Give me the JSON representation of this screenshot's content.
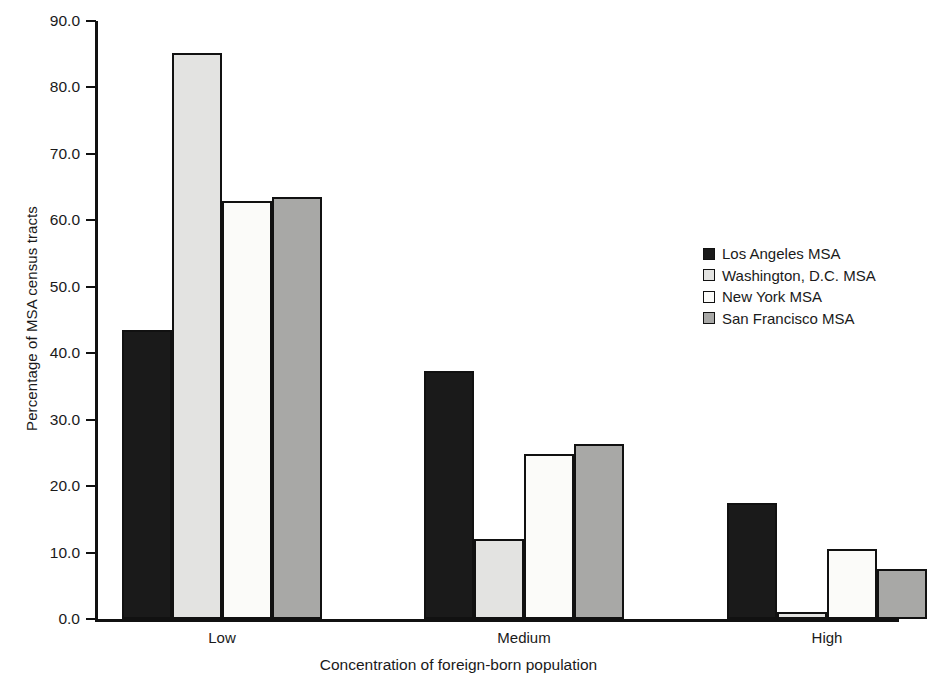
{
  "chart_data": {
    "type": "bar",
    "title": "",
    "xlabel": "Concentration of foreign-born population",
    "ylabel": "Percentage of MSA census tracts",
    "categories": [
      "Low",
      "Medium",
      "High"
    ],
    "ylim": [
      0.0,
      90.0
    ],
    "ytick_labels": [
      "0.0",
      "10.0",
      "20.0",
      "30.0",
      "40.0",
      "50.0",
      "60.0",
      "70.0",
      "80.0",
      "90.0"
    ],
    "ytick_values": [
      0.0,
      10.0,
      20.0,
      30.0,
      40.0,
      50.0,
      60.0,
      70.0,
      80.0,
      90.0
    ],
    "grid": false,
    "legend_position": "right",
    "series": [
      {
        "name": "Los Angeles MSA",
        "color": "#1a1a1a",
        "values": [
          43.5,
          37.3,
          17.5
        ]
      },
      {
        "name": "Washington, D.C. MSA",
        "color": "#e3e3e1",
        "values": [
          85.2,
          12.0,
          1.1
        ]
      },
      {
        "name": "New York MSA",
        "color": "#fbfbf9",
        "values": [
          62.9,
          24.8,
          10.6
        ]
      },
      {
        "name": "San Francisco MSA",
        "color": "#a8a8a6",
        "values": [
          63.5,
          26.3,
          7.6
        ]
      }
    ]
  },
  "axis": {
    "border_color": "#111111",
    "tick_color": "#111111"
  }
}
